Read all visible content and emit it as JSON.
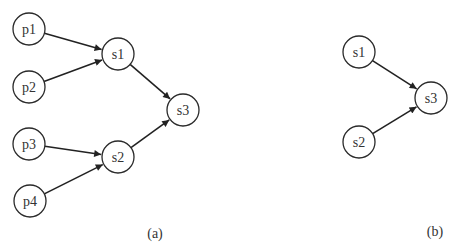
{
  "diagram": {
    "node_radius": 16,
    "colors": {
      "stroke": "#2a2a2a",
      "edge": "#222222",
      "text": "#333333",
      "background": "#ffffff"
    },
    "panels": [
      {
        "id": "a",
        "label": "(a)",
        "label_pos": [
          155,
          238
        ],
        "nodes": [
          {
            "id": "p1",
            "label": "p1",
            "x": 29,
            "y": 29
          },
          {
            "id": "p2",
            "label": "p2",
            "x": 29,
            "y": 87
          },
          {
            "id": "p3",
            "label": "p3",
            "x": 29,
            "y": 144
          },
          {
            "id": "p4",
            "label": "p4",
            "x": 30,
            "y": 201
          },
          {
            "id": "s1",
            "label": "s1",
            "x": 118,
            "y": 54
          },
          {
            "id": "s2",
            "label": "s2",
            "x": 118,
            "y": 157
          },
          {
            "id": "s3",
            "label": "s3",
            "x": 183,
            "y": 110
          }
        ],
        "edges": [
          {
            "from": "p1",
            "to": "s1"
          },
          {
            "from": "p2",
            "to": "s1"
          },
          {
            "from": "p3",
            "to": "s2"
          },
          {
            "from": "p4",
            "to": "s2"
          },
          {
            "from": "s1",
            "to": "s3"
          },
          {
            "from": "s2",
            "to": "s3"
          }
        ]
      },
      {
        "id": "b",
        "label": "(b)",
        "label_pos": [
          435,
          236
        ],
        "nodes": [
          {
            "id": "s1",
            "label": "s1",
            "x": 359,
            "y": 52
          },
          {
            "id": "s2",
            "label": "s2",
            "x": 359,
            "y": 142
          },
          {
            "id": "s3",
            "label": "s3",
            "x": 431,
            "y": 98
          }
        ],
        "edges": [
          {
            "from": "s1",
            "to": "s3"
          },
          {
            "from": "s2",
            "to": "s3"
          }
        ]
      }
    ]
  }
}
